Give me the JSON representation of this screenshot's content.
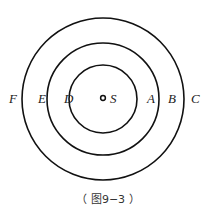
{
  "diagram": {
    "center": {
      "label": "S"
    },
    "points": [
      {
        "label": "F"
      },
      {
        "label": "E"
      },
      {
        "label": "D"
      },
      {
        "label": "A"
      },
      {
        "label": "B"
      },
      {
        "label": "C"
      }
    ],
    "circles": [
      "inner",
      "middle",
      "outer"
    ],
    "caption": "（ 图9−3 ）"
  }
}
